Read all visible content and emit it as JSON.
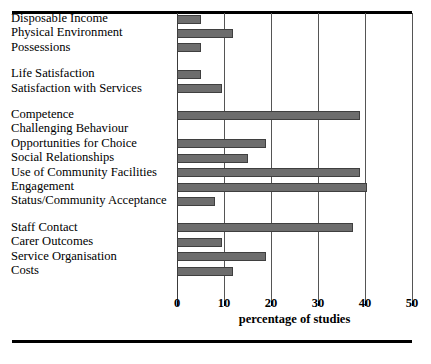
{
  "chart_data": {
    "type": "bar",
    "orientation": "horizontal",
    "title": "",
    "subtitle": "",
    "xlabel": "percentage of studies",
    "ylabel": "",
    "xlim": [
      0,
      50
    ],
    "xticks": [
      0,
      10,
      20,
      30,
      40,
      50
    ],
    "xtick_labels": [
      "0",
      "10",
      "20",
      "30",
      "40",
      "50"
    ],
    "grid": true,
    "grid_axis": "x",
    "legend": null,
    "bar_color": "#6d6d6d",
    "bar_edge_color": "#3f3f3f",
    "groups": [
      {
        "name": "material-wellbeing",
        "items": [
          {
            "category": "Disposable Income",
            "value": 5
          },
          {
            "category": "Physical Environment",
            "value": 12
          },
          {
            "category": "Possessions",
            "value": 5
          }
        ]
      },
      {
        "name": "satisfaction",
        "items": [
          {
            "category": "Life Satisfaction",
            "value": 5
          },
          {
            "category": "Satisfaction with Services",
            "value": 9.5
          }
        ]
      },
      {
        "name": "personal-development",
        "items": [
          {
            "category": "Competence",
            "value": 39
          },
          {
            "category": "Challenging Behaviour",
            "value": 0
          },
          {
            "category": "Opportunities for Choice",
            "value": 19
          },
          {
            "category": "Social Relationships",
            "value": 15
          },
          {
            "category": "Use of Community Facilities",
            "value": 39
          },
          {
            "category": "Engagement",
            "value": 40.5
          },
          {
            "category": "Status/Community Acceptance",
            "value": 8
          }
        ]
      },
      {
        "name": "service-factors",
        "items": [
          {
            "category": "Staff Contact",
            "value": 37.5
          },
          {
            "category": "Carer Outcomes",
            "value": 9.5
          },
          {
            "category": "Service Organisation",
            "value": 19
          },
          {
            "category": "Costs",
            "value": 12
          }
        ]
      }
    ],
    "categories": [
      "Disposable Income",
      "Physical Environment",
      "Possessions",
      "Life Satisfaction",
      "Satisfaction with Services",
      "Competence",
      "Challenging Behaviour",
      "Opportunities for Choice",
      "Social Relationships",
      "Use of Community Facilities",
      "Engagement",
      "Status/Community Acceptance",
      "Staff Contact",
      "Carer Outcomes",
      "Service Organisation",
      "Costs"
    ],
    "values": [
      5,
      12,
      5,
      5,
      9.5,
      39,
      0,
      19,
      15,
      39,
      40.5,
      8,
      37.5,
      9.5,
      19,
      12
    ]
  }
}
